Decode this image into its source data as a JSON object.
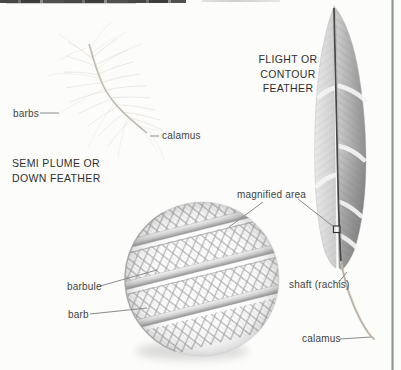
{
  "diagram": {
    "semi_plume": {
      "line1": "SEMI PLUME OR",
      "line2": "DOWN FEATHER"
    },
    "flight": {
      "line1": "FLIGHT OR",
      "line2": "CONTOUR",
      "line3": "FEATHER"
    },
    "labels": {
      "barbs": "barbs",
      "calamus_down": "calamus",
      "magnified_area": "magnified area",
      "barbule": "barbule",
      "barb": "barb",
      "shaft": "shaft (rachis)",
      "calamus_flight": "calamus"
    },
    "colors": {
      "background": "#fcfcfb",
      "text": "#424242",
      "heading_text": "#2e2e2e",
      "leader_line": "#8b8b8b",
      "page_edge_line": "#8f969a",
      "feather_dark_shaft": "#4a4a4a"
    }
  }
}
